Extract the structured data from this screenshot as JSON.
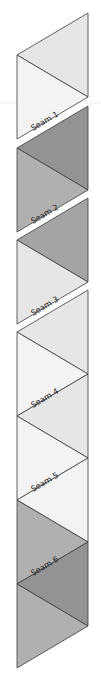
{
  "diagram": {
    "seams": [
      {
        "label": "Seam 1"
      },
      {
        "label": "Seam 2"
      },
      {
        "label": "Seam 3"
      },
      {
        "label": "Seam 4"
      },
      {
        "label": "Seam 5"
      },
      {
        "label": "Seam 6"
      }
    ],
    "colors": {
      "outline": "#3a3a3a",
      "light": "#e6e6e6",
      "lightest": "#f3f3f3",
      "medium": "#b0b0b0",
      "medium_dark": "#a4a4a4",
      "dark": "#939393"
    }
  }
}
